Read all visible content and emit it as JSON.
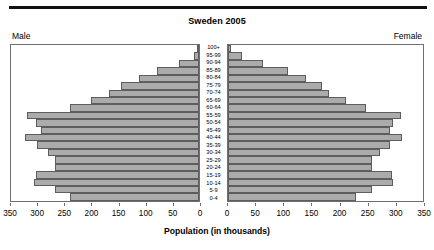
{
  "chart_data": {
    "type": "bar",
    "subtype": "population-pyramid",
    "title": "Sweden 2005",
    "xlabel": "Population (in thousands)",
    "ylabel": "",
    "left_panel_label": "Male",
    "right_panel_label": "Female",
    "categories": [
      "100+",
      "95-99",
      "90-94",
      "85-89",
      "80-84",
      "75-79",
      "70-74",
      "65-69",
      "60-64",
      "55-59",
      "50-54",
      "45-49",
      "40-44",
      "35-39",
      "30-34",
      "25-29",
      "20-24",
      "15-19",
      "10-14",
      "5-9",
      "0-4"
    ],
    "series": [
      {
        "name": "Male",
        "direction": "left",
        "values": [
          2,
          10,
          38,
          78,
          112,
          145,
          168,
          202,
          240,
          320,
          303,
          295,
          324,
          302,
          282,
          268,
          268,
          303,
          308,
          268,
          240
        ]
      },
      {
        "name": "Female",
        "direction": "right",
        "values": [
          6,
          26,
          62,
          107,
          140,
          168,
          182,
          212,
          248,
          310,
          296,
          290,
          313,
          291,
          272,
          258,
          258,
          295,
          296,
          258,
          229
        ]
      }
    ],
    "xlim_left": [
      350,
      0
    ],
    "xlim_right": [
      0,
      350
    ],
    "xticks_left": [
      "350",
      "300",
      "250",
      "200",
      "150",
      "100",
      "50",
      "0"
    ],
    "xticks_right": [
      "0",
      "50",
      "100",
      "150",
      "200",
      "250",
      "300",
      "350"
    ],
    "axis_max": 350,
    "grid": false,
    "legend": "none",
    "bar_color": "#ababab",
    "bar_edge_color": "#5d5d5d",
    "axis_color": "#6f6f6f",
    "rule_color": "#111111"
  }
}
